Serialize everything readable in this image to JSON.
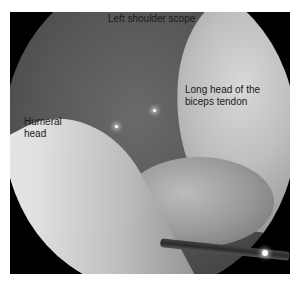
{
  "figure": {
    "labels": {
      "title": "Left shoulder scope",
      "tendon": "Long head of the\nbiceps tendon",
      "humeral": "Humeral\nhead"
    },
    "colors": {
      "background": "#000000",
      "page": "#ffffff",
      "label_text": "#1a1a1a"
    }
  }
}
